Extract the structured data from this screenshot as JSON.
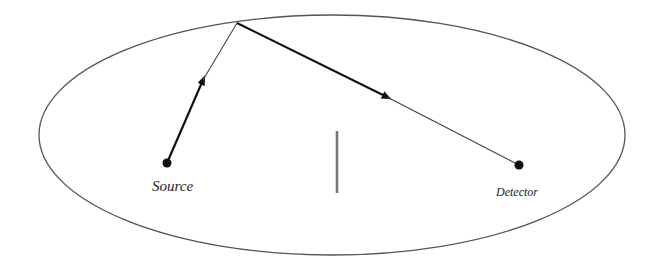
{
  "diagram": {
    "type": "reflection-path",
    "labels": {
      "source": "Source",
      "detector": "Detector"
    },
    "colors": {
      "outline": "#555555",
      "path": "#111111",
      "barrier": "#777777",
      "background": "#ffffff"
    },
    "boundary": {
      "shape": "ellipse",
      "cx": 332,
      "cy": 135,
      "rx": 293,
      "ry": 120
    },
    "points": {
      "source": {
        "x": 167,
        "y": 163
      },
      "reflection": {
        "x": 237,
        "y": 23
      },
      "detector": {
        "x": 519,
        "y": 165
      }
    },
    "barrier": {
      "x": 337,
      "y1": 131,
      "y2": 193
    }
  }
}
